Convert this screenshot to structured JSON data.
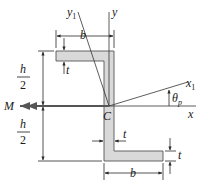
{
  "figure": {
    "type": "Z-section beam cross-section with principal axes",
    "section_fill_color": "#d9d9d9",
    "section_outline_color": "#555555",
    "moment_arrow_color": "#555555",
    "labels": {
      "y1_axis": "y",
      "y1_sub": "1",
      "y_axis": "y",
      "x1_axis": "x",
      "x1_sub": "1",
      "x_axis": "x",
      "theta": "θ",
      "theta_sub": "p",
      "centroid": "C",
      "moment": "M",
      "top_flange_width": "b",
      "bottom_flange_width": "b",
      "top_flange_thickness": "t",
      "web_thickness": "t",
      "bottom_flange_thickness": "t",
      "half_height_top_num": "h",
      "half_height_top_den": "2",
      "half_height_bottom_num": "h",
      "half_height_bottom_den": "2"
    }
  }
}
